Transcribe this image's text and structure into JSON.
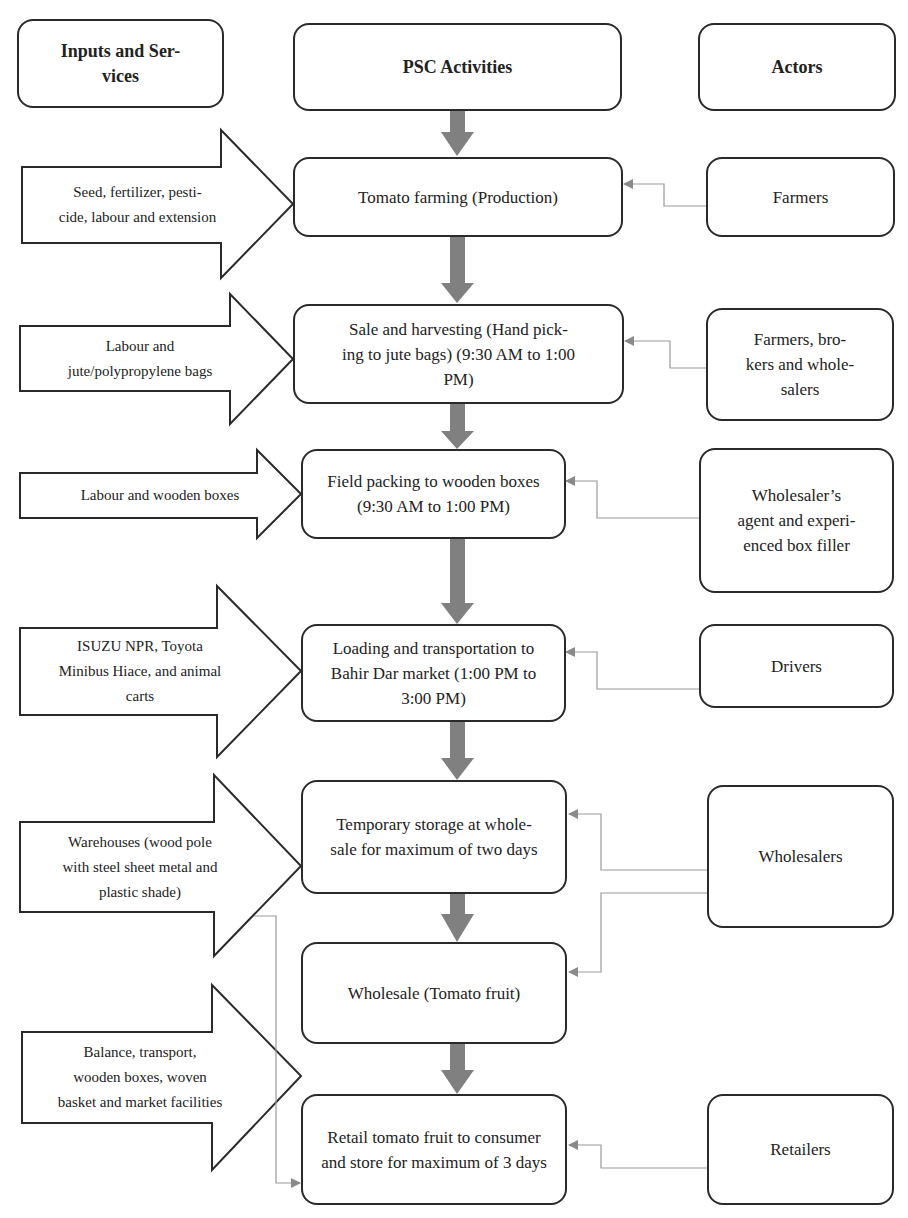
{
  "headers": {
    "inputs": "Inputs and Ser-\nvices",
    "activities": "PSC Activities",
    "actors": "Actors"
  },
  "inputs": [
    "Seed, fertilizer, pesti-\ncide, labour and extension",
    "Labour and\njute/polypropylene bags",
    "Labour and wooden boxes",
    "ISUZU NPR, Toyota\nMinibus Hiace, and animal\ncarts",
    "Warehouses (wood pole\nwith steel sheet metal and\nplastic shade)",
    "Balance, transport,\nwooden boxes, woven\nbasket and market facilities"
  ],
  "activities": [
    "Tomato farming (Production)",
    "Sale and harvesting (Hand pick-\ning to jute bags) (9:30 AM to 1:00\nPM)",
    "Field packing to wooden boxes\n(9:30 AM to 1:00 PM)",
    "Loading and transportation to\nBahir Dar market (1:00 PM to\n3:00 PM)",
    "Temporary storage at whole-\nsale for maximum of two days",
    "Wholesale (Tomato fruit)",
    "Retail tomato fruit to consumer\nand store for maximum of 3 days"
  ],
  "actors": [
    "Farmers",
    "Farmers, bro-\nkers and whole-\nsalers",
    "Wholesaler’s\nagent and experi-\nenced box filler",
    "Drivers",
    "Wholesalers",
    "Retailers"
  ],
  "colors": {
    "flow_arrow": "#808080",
    "connector": "#9a9a9a",
    "outline": "#2a2a2a"
  }
}
